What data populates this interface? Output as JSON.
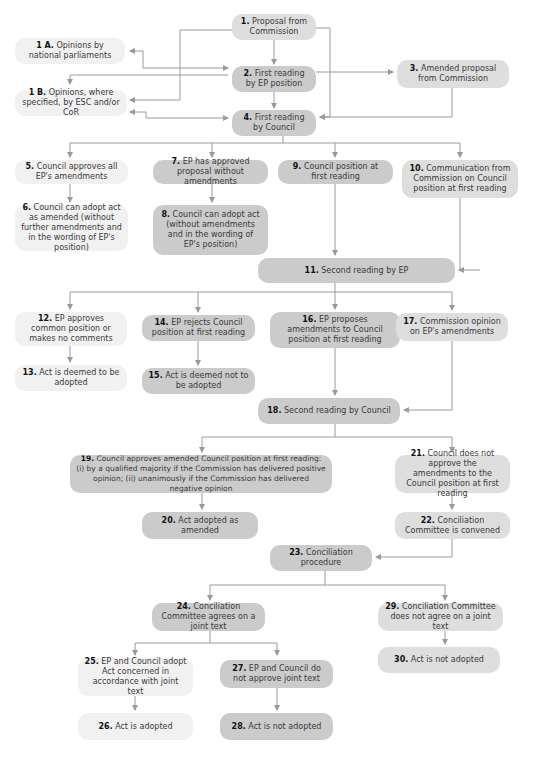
{
  "diagram": {
    "type": "flowchart",
    "connector_color": "#9a9a9a",
    "shades": {
      "light": "#f1f1f1",
      "medium": "#dedede",
      "dark": "#cbcbcb"
    },
    "nodes": [
      {
        "id": "1",
        "num": "1.",
        "text": "Proposal from Commission"
      },
      {
        "id": "1A",
        "num": "1 A.",
        "text": "Opinions by national parliaments"
      },
      {
        "id": "2",
        "num": "2.",
        "text": "First reading by EP position"
      },
      {
        "id": "3",
        "num": "3.",
        "text": "Amended proposal from Commission"
      },
      {
        "id": "1B",
        "num": "1 B.",
        "text": "Opinions, where specified, by ESC and/or CoR"
      },
      {
        "id": "4",
        "num": "4.",
        "text": "First reading by Council"
      },
      {
        "id": "5",
        "num": "5.",
        "text": "Council approves all EP's amendments"
      },
      {
        "id": "6",
        "num": "6.",
        "text": "Council can adopt act as amended (without further amendments and in the wording of EP's position)"
      },
      {
        "id": "7",
        "num": "7.",
        "text": "EP has approved proposal without amendments"
      },
      {
        "id": "8",
        "num": "8.",
        "text": "Council can adopt act (without amendments and in the wording of EP's position)"
      },
      {
        "id": "9",
        "num": "9.",
        "text": "Council position at first reading"
      },
      {
        "id": "10",
        "num": "10.",
        "text": "Communication from Commission on Council position at first reading"
      },
      {
        "id": "11",
        "num": "11.",
        "text": "Second reading by EP"
      },
      {
        "id": "12",
        "num": "12.",
        "text": "EP approves common position or makes no comments"
      },
      {
        "id": "13",
        "num": "13.",
        "text": "Act is deemed to be adopted"
      },
      {
        "id": "14",
        "num": "14.",
        "text": "EP rejects Council position at first reading"
      },
      {
        "id": "15",
        "num": "15.",
        "text": "Act is deemed not to be adopted"
      },
      {
        "id": "16",
        "num": "16.",
        "text": "EP proposes amendments to Council position at first reading"
      },
      {
        "id": "17",
        "num": "17.",
        "text": "Commission opinion on EP's amendments"
      },
      {
        "id": "18",
        "num": "18.",
        "text": "Second reading by Council"
      },
      {
        "id": "19",
        "num": "19.",
        "text": "Council approves amended Council position at first reading: (i) by a qualified majority if the Commission has delivered positive opinion; (ii) unanimously if the Commission has delivered negative opinion"
      },
      {
        "id": "20",
        "num": "20.",
        "text": "Act adopted as amended"
      },
      {
        "id": "21",
        "num": "21.",
        "text": "Council does not approve the amendments to the Council position at first reading"
      },
      {
        "id": "22",
        "num": "22.",
        "text": "Conciliation Committee is convened"
      },
      {
        "id": "23",
        "num": "23.",
        "text": "Conciliation procedure"
      },
      {
        "id": "24",
        "num": "24.",
        "text": "Conciliation Committee agrees on a joint text"
      },
      {
        "id": "25",
        "num": "25.",
        "text": "EP and Council adopt Act concerned in accordance with joint text"
      },
      {
        "id": "26",
        "num": "26.",
        "text": "Act is adopted"
      },
      {
        "id": "27",
        "num": "27.",
        "text": "EP and Council do not approve joint text"
      },
      {
        "id": "28",
        "num": "28.",
        "text": "Act is not adopted"
      },
      {
        "id": "29",
        "num": "29.",
        "text": "Conciliation Committee does not agree on a joint text"
      },
      {
        "id": "30",
        "num": "30.",
        "text": "Act is not adopted"
      }
    ],
    "edges": [
      [
        "1",
        "2"
      ],
      [
        "1",
        "1B"
      ],
      [
        "1",
        "4"
      ],
      [
        "2",
        "1A"
      ],
      [
        "1A",
        "2"
      ],
      [
        "2",
        "1B"
      ],
      [
        "1B",
        "2"
      ],
      [
        "2",
        "3"
      ],
      [
        "2",
        "4"
      ],
      [
        "3",
        "4"
      ],
      [
        "1B",
        "4"
      ],
      [
        "4",
        "1B"
      ],
      [
        "4",
        "5"
      ],
      [
        "4",
        "7"
      ],
      [
        "4",
        "9"
      ],
      [
        "4",
        "10"
      ],
      [
        "5",
        "6"
      ],
      [
        "7",
        "8"
      ],
      [
        "9",
        "11"
      ],
      [
        "10",
        "11"
      ],
      [
        "11",
        "12"
      ],
      [
        "11",
        "14"
      ],
      [
        "11",
        "16"
      ],
      [
        "11",
        "17"
      ],
      [
        "12",
        "13"
      ],
      [
        "14",
        "15"
      ],
      [
        "16",
        "18"
      ],
      [
        "17",
        "18"
      ],
      [
        "18",
        "19"
      ],
      [
        "18",
        "21"
      ],
      [
        "19",
        "20"
      ],
      [
        "21",
        "22"
      ],
      [
        "22",
        "23"
      ],
      [
        "23",
        "24"
      ],
      [
        "23",
        "29"
      ],
      [
        "24",
        "25"
      ],
      [
        "24",
        "27"
      ],
      [
        "25",
        "26"
      ],
      [
        "27",
        "28"
      ],
      [
        "29",
        "30"
      ]
    ]
  }
}
